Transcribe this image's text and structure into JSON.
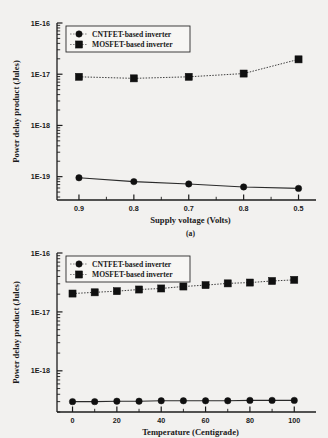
{
  "chart_data": [
    {
      "type": "line",
      "id": "fig-a",
      "title": "",
      "caption": "(a)",
      "xlabel": "Supply voltage (Volts)",
      "ylabel": "Power delay product (Jules)",
      "xscale": "linear",
      "yscale": "log",
      "grid": false,
      "legend_position": "top-left",
      "x": [
        0.9,
        0.8,
        0.7,
        0.6,
        0.5
      ],
      "xtick_labels": [
        "0.9",
        "0.8",
        "0.7",
        "0.8",
        "0.5"
      ],
      "ytick_labels": [
        "1E-16",
        "1E-17",
        "1E-18",
        "1E-19"
      ],
      "ylim": [
        3.5e-20,
        1e-16
      ],
      "series": [
        {
          "name": "CNTFET-based inverter",
          "marker": "circle",
          "linestyle": "solid",
          "values": [
            9.5e-20,
            8e-20,
            7.2e-20,
            6.3e-20,
            5.9e-20
          ]
        },
        {
          "name": "MOSFET-based inverter",
          "marker": "square",
          "linestyle": "dotted",
          "values": [
            8.9e-18,
            8.3e-18,
            8.9e-18,
            1.03e-17,
            1.95e-17
          ]
        }
      ]
    },
    {
      "type": "line",
      "id": "fig-b",
      "title": "",
      "caption": "",
      "xlabel": "Temperature (Centigrade)",
      "ylabel": "Power delay product (Jules)",
      "xscale": "linear",
      "yscale": "log",
      "grid": false,
      "legend_position": "top-left",
      "x": [
        0,
        10,
        20,
        30,
        40,
        50,
        60,
        70,
        80,
        90,
        100
      ],
      "xtick_labels": [
        "0",
        "20",
        "40",
        "60",
        "80",
        "100"
      ],
      "xtick_values": [
        0,
        20,
        40,
        60,
        80,
        100
      ],
      "ytick_labels": [
        "1E-16",
        "1E-17",
        "1E-18"
      ],
      "ylim": [
        2e-19,
        1e-16
      ],
      "series": [
        {
          "name": "CNTFET-based inverter",
          "marker": "circle",
          "linestyle": "solid",
          "values": [
            3e-19,
            3e-19,
            3.05e-19,
            3.05e-19,
            3.1e-19,
            3.1e-19,
            3.1e-19,
            3.1e-19,
            3.15e-19,
            3.15e-19,
            3.15e-19
          ]
        },
        {
          "name": "MOSFET-based inverter",
          "marker": "square",
          "linestyle": "dotted",
          "values": [
            2.05e-17,
            2.15e-17,
            2.25e-17,
            2.4e-17,
            2.5e-17,
            2.7e-17,
            2.85e-17,
            3.05e-17,
            3.15e-17,
            3.35e-17,
            3.5e-17
          ]
        }
      ]
    }
  ],
  "colors": {
    "ink": "#1a1a1a",
    "marker": "#101010",
    "paper": "#f2f1ef"
  }
}
